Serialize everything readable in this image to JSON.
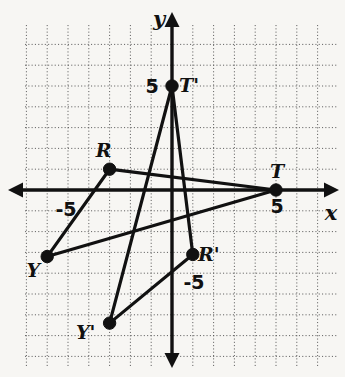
{
  "figure": {
    "kind": "coordinate-plane-transformation",
    "background_color": "#f7f6f3",
    "ink_color": "#111111",
    "grid_color": "#4a4a4a"
  },
  "chart_data": {
    "type": "scatter",
    "title": "",
    "xlabel": "x",
    "ylabel": "y",
    "xlim": [
      -7,
      8
    ],
    "ylim": [
      -8,
      8
    ],
    "grid": true,
    "grid_step": 1,
    "legend": "none",
    "axis_labels": {
      "x_axis_name": "x",
      "y_axis_name": "y"
    },
    "tick_labels": [
      {
        "text": "5",
        "axis": "x",
        "value": 5
      },
      {
        "text": "-5",
        "axis": "x",
        "value": -5
      },
      {
        "text": "5",
        "axis": "y",
        "value": 5
      },
      {
        "text": "-5",
        "axis": "y",
        "value": -5
      }
    ],
    "points": [
      {
        "name": "R",
        "label": "R",
        "x": -3,
        "y": 1,
        "label_dx": -6,
        "label_dy": -12
      },
      {
        "name": "Y",
        "label": "Y",
        "x": -6,
        "y": -3.2,
        "label_dx": -14,
        "label_dy": 20
      },
      {
        "name": "T",
        "label": "T",
        "x": 5,
        "y": 0,
        "label_dx": 1,
        "label_dy": -12
      },
      {
        "name": "Tp",
        "label": "T'",
        "x": 0,
        "y": 5,
        "label_dx": 17,
        "label_dy": 6
      },
      {
        "name": "Rp",
        "label": "R'",
        "x": 1,
        "y": -3.1,
        "label_dx": 16,
        "label_dy": 7
      },
      {
        "name": "Yp",
        "label": "Y'",
        "x": -3,
        "y": -6.4,
        "label_dx": -24,
        "label_dy": 16
      }
    ],
    "segments": [
      {
        "from": "R",
        "to": "Y",
        "series": "triangle-RYT"
      },
      {
        "from": "R",
        "to": "T",
        "series": "triangle-RYT"
      },
      {
        "from": "Y",
        "to": "T",
        "series": "triangle-RYT"
      },
      {
        "from": "Rp",
        "to": "Yp",
        "series": "triangle-RpYpTp"
      },
      {
        "from": "Rp",
        "to": "Tp",
        "series": "triangle-RpYpTp"
      },
      {
        "from": "Yp",
        "to": "Tp",
        "series": "triangle-RpYpTp"
      }
    ],
    "series": [
      {
        "name": "triangle-RYT",
        "vertices": [
          "R",
          "Y",
          "T"
        ]
      },
      {
        "name": "triangle-RpYpTp",
        "vertices": [
          "R'",
          "Y'",
          "T'"
        ]
      }
    ]
  },
  "geometry": {
    "origin_px": {
      "x": 172,
      "y": 190
    },
    "unit_px": 20.8,
    "grid_bounds_px": {
      "left": 25,
      "right": 337,
      "top": 25,
      "bottom": 366
    },
    "x_axis_px": {
      "x1": 8,
      "x2": 339,
      "y": 190
    },
    "y_axis_px": {
      "y1": 12,
      "y2": 368,
      "x": 172
    }
  }
}
